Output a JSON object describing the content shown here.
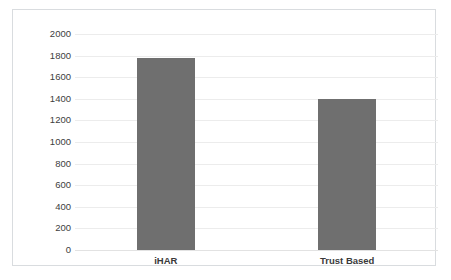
{
  "chart_data": {
    "type": "bar",
    "title": "",
    "subtitle": "",
    "xlabel": "",
    "ylabel": "",
    "categories": [
      "iHAR",
      "Trust Based"
    ],
    "values": [
      1780,
      1400
    ],
    "series": [
      {
        "name": "Series 1",
        "values": [
          1780,
          1400
        ]
      }
    ],
    "ylim": [
      0,
      2000
    ],
    "ytick_labels": [
      "0",
      "200",
      "400",
      "600",
      "800",
      "1000",
      "1200",
      "1400",
      "1600",
      "1800",
      "2000"
    ],
    "ytick_values": [
      0,
      200,
      400,
      600,
      800,
      1000,
      1200,
      1400,
      1600,
      1800,
      2000
    ],
    "ytick_step": 200,
    "grid": true,
    "grid_axis": "y",
    "legend": false,
    "legend_position": "none",
    "annotations": [],
    "bar_color": "#6f6f6f",
    "grid_color": "#ececec",
    "frame_color": "#d9dcdf",
    "background_color": "#ffffff",
    "label_color": "#404040"
  }
}
